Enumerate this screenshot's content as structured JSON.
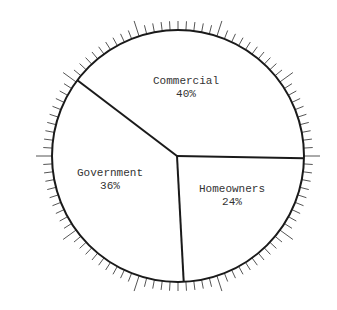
{
  "chart_data": {
    "type": "pie",
    "title": "",
    "categories": [
      "Commercial",
      "Homeowners",
      "Government"
    ],
    "values": [
      40,
      24,
      36
    ],
    "unit": "%",
    "slices": [
      {
        "name": "Commercial",
        "value": 40,
        "label": "40%"
      },
      {
        "name": "Homeowners",
        "value": 24,
        "label": "24%"
      },
      {
        "name": "Government",
        "value": 36,
        "label": "36%"
      }
    ],
    "tick_marks": {
      "count": 100,
      "major_every": 10
    },
    "colors": {
      "stroke": "#1a1a1a",
      "fill": "#ffffff",
      "tick": "#555555"
    }
  }
}
